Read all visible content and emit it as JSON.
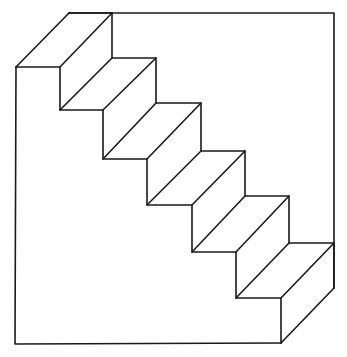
{
  "figure": {
    "step_count": 6,
    "colors": {
      "line": "#1a1a1a",
      "background": "#ffffff"
    }
  },
  "geometry": {
    "outline": [
      [
        16,
        67
      ],
      [
        69,
        13
      ],
      [
        334,
        13
      ],
      [
        334,
        288
      ],
      [
        281,
        343
      ],
      [
        15,
        344
      ]
    ],
    "front_profile": [
      [
        16,
        67
      ],
      [
        60,
        67
      ],
      [
        60,
        110
      ],
      [
        103,
        110
      ],
      [
        103,
        159
      ],
      [
        147,
        159
      ],
      [
        147,
        205
      ],
      [
        192,
        205
      ],
      [
        192,
        252
      ],
      [
        236,
        252
      ],
      [
        236,
        298
      ],
      [
        281,
        298
      ],
      [
        281,
        343
      ]
    ],
    "back_profile": [
      [
        69,
        13
      ],
      [
        112,
        13
      ],
      [
        112,
        58
      ],
      [
        156,
        58
      ],
      [
        156,
        103
      ],
      [
        201,
        103
      ],
      [
        201,
        151
      ],
      [
        245,
        151
      ],
      [
        245,
        196
      ],
      [
        289,
        196
      ],
      [
        289,
        243
      ],
      [
        334,
        243
      ],
      [
        334,
        288
      ]
    ]
  }
}
